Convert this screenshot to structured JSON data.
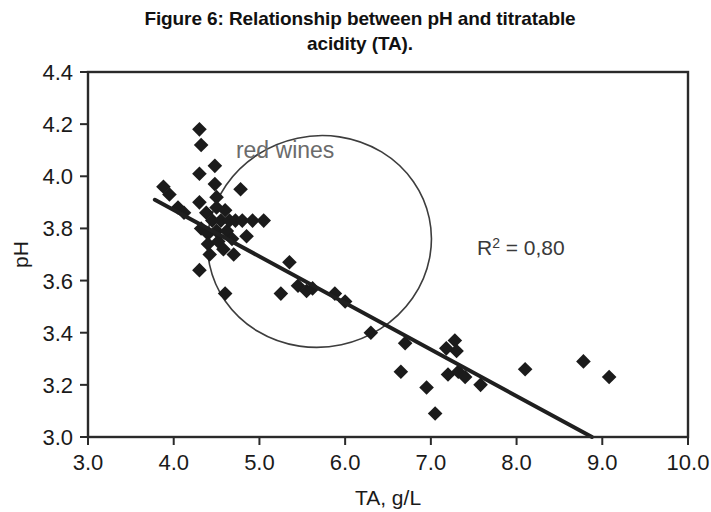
{
  "chart_data": {
    "type": "scatter",
    "title": "Figure 6: Relationship between pH and titratable acidity (TA).",
    "title_line1": "Figure 6: Relationship between pH and titratable",
    "title_line2": "acidity (TA).",
    "xlabel": "TA, g/L",
    "ylabel": "pH",
    "xlim": [
      3.0,
      10.0
    ],
    "ylim": [
      3.0,
      4.4
    ],
    "xticks": [
      "3.0",
      "4.0",
      "5.0",
      "6.0",
      "7.0",
      "8.0",
      "9.0",
      "10.0"
    ],
    "yticks": [
      "3.0",
      "3.2",
      "3.4",
      "3.6",
      "3.8",
      "4.0",
      "4.2",
      "4.4"
    ],
    "xtick_values": [
      3.0,
      4.0,
      5.0,
      6.0,
      7.0,
      8.0,
      9.0,
      10.0
    ],
    "ytick_values": [
      3.0,
      3.2,
      3.4,
      3.6,
      3.8,
      4.0,
      4.2,
      4.4
    ],
    "grid": false,
    "legend": false,
    "marker_shape": "diamond",
    "marker_color": "#1b1b1b",
    "series": [
      {
        "name": "wines",
        "points": [
          [
            3.88,
            3.96
          ],
          [
            3.95,
            3.93
          ],
          [
            4.05,
            3.88
          ],
          [
            4.12,
            3.86
          ],
          [
            4.3,
            4.18
          ],
          [
            4.32,
            4.12
          ],
          [
            4.3,
            4.01
          ],
          [
            4.3,
            3.9
          ],
          [
            4.3,
            3.64
          ],
          [
            4.32,
            3.8
          ],
          [
            4.38,
            3.86
          ],
          [
            4.4,
            3.78
          ],
          [
            4.4,
            3.74
          ],
          [
            4.42,
            3.7
          ],
          [
            4.45,
            3.83
          ],
          [
            4.48,
            4.04
          ],
          [
            4.48,
            3.97
          ],
          [
            4.5,
            3.92
          ],
          [
            4.5,
            3.88
          ],
          [
            4.5,
            3.79
          ],
          [
            4.52,
            3.75
          ],
          [
            4.55,
            3.83
          ],
          [
            4.58,
            3.72
          ],
          [
            4.6,
            3.87
          ],
          [
            4.62,
            3.79
          ],
          [
            4.65,
            3.83
          ],
          [
            4.68,
            3.76
          ],
          [
            4.7,
            3.7
          ],
          [
            4.72,
            3.83
          ],
          [
            4.78,
            3.95
          ],
          [
            4.8,
            3.83
          ],
          [
            4.85,
            3.77
          ],
          [
            4.92,
            3.83
          ],
          [
            5.05,
            3.83
          ],
          [
            4.6,
            3.55
          ],
          [
            5.25,
            3.55
          ],
          [
            5.35,
            3.67
          ],
          [
            5.45,
            3.58
          ],
          [
            5.55,
            3.56
          ],
          [
            5.62,
            3.57
          ],
          [
            5.88,
            3.55
          ],
          [
            6.0,
            3.52
          ],
          [
            6.3,
            3.4
          ],
          [
            6.65,
            3.25
          ],
          [
            6.7,
            3.36
          ],
          [
            6.95,
            3.19
          ],
          [
            7.05,
            3.09
          ],
          [
            7.18,
            3.34
          ],
          [
            7.2,
            3.24
          ],
          [
            7.28,
            3.37
          ],
          [
            7.3,
            3.33
          ],
          [
            7.32,
            3.25
          ],
          [
            7.4,
            3.23
          ],
          [
            7.58,
            3.2
          ],
          [
            8.1,
            3.26
          ],
          [
            8.78,
            3.29
          ],
          [
            9.08,
            3.23
          ]
        ]
      }
    ],
    "trendline": {
      "label": "linear fit",
      "x_start": 3.78,
      "y_start": 3.91,
      "x_end": 8.88,
      "y_end": 3.0
    },
    "annotations": [
      {
        "name": "r-squared",
        "text": "R2 = 0,80",
        "prefix": "R",
        "superscript": "2",
        "suffix": " = 0,80",
        "x": 8.05,
        "y": 3.7
      },
      {
        "name": "cluster-label",
        "text": "red wines",
        "x": 5.3,
        "y": 4.07
      }
    ],
    "cluster_ellipse": {
      "label": "red wines",
      "center_x": 5.7,
      "center_y": 3.75,
      "radius_x": 1.31,
      "radius_y": 0.405,
      "rotation": -12
    }
  }
}
